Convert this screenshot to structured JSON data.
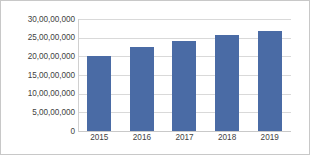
{
  "chart_data": {
    "type": "bar",
    "title": "",
    "subtitle": "",
    "xlabel": "",
    "ylabel": "",
    "categories": [
      "2015",
      "2016",
      "2017",
      "2018",
      "2019"
    ],
    "values": [
      201000000,
      224000000,
      242000000,
      256000000,
      269000000
    ],
    "series": [
      {
        "name": "",
        "values": [
          201000000,
          224000000,
          242000000,
          256000000,
          269000000
        ]
      }
    ],
    "ylim": [
      0,
      300000000
    ],
    "ytick_values": [
      0,
      50000000,
      100000000,
      150000000,
      200000000,
      250000000,
      300000000
    ],
    "ytick_labels": [
      "0",
      "5,00,00,000",
      "10,00,00,000",
      "15,00,00,000",
      "20,00,00,000",
      "25,00,00,000",
      "30,00,00,000"
    ],
    "bar_color": "#4a6ba5",
    "gridline_color": "#d9d9d9",
    "grid": "horizontal",
    "legend": "none",
    "legend_entries": [],
    "annotations": [],
    "border_color": "#c8c8c8"
  }
}
